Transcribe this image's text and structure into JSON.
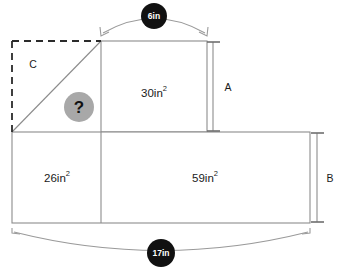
{
  "diagram": {
    "canvas": {
      "width": 337,
      "height": 274,
      "background": "#ffffff"
    },
    "regions": {
      "triangle_c": {
        "label": "C",
        "description": "dashed-bounded right triangle, unknown area"
      },
      "middle_rect": {
        "area_value": "30",
        "area_unit": "in",
        "area_exponent": "2",
        "area_label": "30in²"
      },
      "left_rect": {
        "area_value": "26",
        "area_unit": "in",
        "area_exponent": "2",
        "area_label": "26in²"
      },
      "right_rect": {
        "area_value": "59",
        "area_unit": "in",
        "area_exponent": "2",
        "area_label": "59in²"
      }
    },
    "dimensions": {
      "top": {
        "badge_value": "6",
        "badge_unit": "in",
        "badge_label": "6in"
      },
      "bottom": {
        "badge_value": "17",
        "badge_unit": "in",
        "badge_label": "17in"
      },
      "right_upper": {
        "label": "A"
      },
      "right_lower": {
        "label": "B"
      }
    },
    "unknown_marker": {
      "glyph": "?",
      "fill": "#a8a8a8",
      "text_color": "#111111"
    },
    "colors": {
      "stroke": "#8c8c8c",
      "dashed_stroke": "#2b2b2b",
      "badge_fill": "#111111",
      "badge_text": "#ffffff",
      "text": "#1a1a1a",
      "arc": "#9a9a9a"
    }
  }
}
